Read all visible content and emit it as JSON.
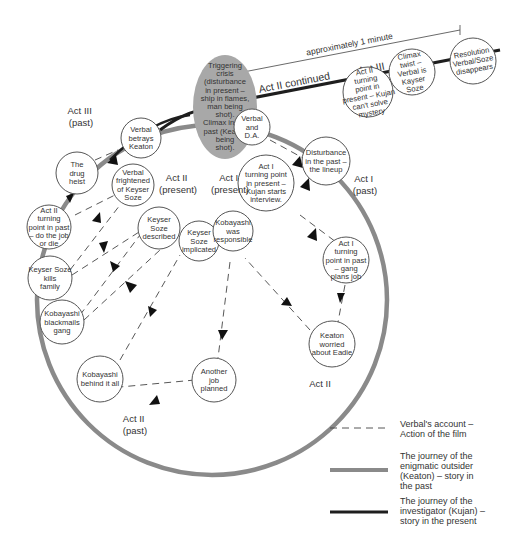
{
  "diagram": {
    "timeline": {
      "duration_label": "approximately 1 minute",
      "act2_continued_label": "Act II continued",
      "act3_label": "Act III"
    },
    "crisis": {
      "lines": [
        "Triggering",
        "crisis",
        "(disturbance",
        "in present –",
        "ship in flames,",
        "man being",
        "shot).",
        "Climax in the",
        "past (Keaton",
        "being",
        "shot)."
      ],
      "fill": "#a8a8a8"
    },
    "present_nodes": [
      {
        "id": "act2-turning-present",
        "lines": [
          "Act II",
          "turning",
          "point in",
          "present – Kujan",
          "can't solve",
          "mystery"
        ]
      },
      {
        "id": "climax-twist",
        "lines": [
          "Climax",
          "twist –",
          "Verbal is",
          "Kayser",
          "Soze"
        ]
      },
      {
        "id": "resolution",
        "lines": [
          "Resolution",
          "Verbal/Soze",
          "disappears"
        ]
      }
    ],
    "nodes": [
      {
        "id": "verbal-da",
        "lines": [
          "Verbal",
          "and",
          "D.A."
        ]
      },
      {
        "id": "disturbance-past",
        "lines": [
          "Disturbance",
          "in the past –",
          "the lineup"
        ]
      },
      {
        "id": "act1-turning-present",
        "lines": [
          "Act I",
          "turning point",
          "in present –",
          "Kujan starts",
          "interview."
        ]
      },
      {
        "id": "act1-turning-past",
        "lines": [
          "Act I",
          "turning",
          "point in past",
          "– gang",
          "plans job"
        ]
      },
      {
        "id": "keaton-worried",
        "lines": [
          "Keaton",
          "worried",
          "about Eadie"
        ]
      },
      {
        "id": "another-job",
        "lines": [
          "Another",
          "job",
          "planned"
        ]
      },
      {
        "id": "kobayashi-behind",
        "lines": [
          "Kobayashi",
          "behind it all"
        ]
      },
      {
        "id": "kobayashi-blackmails",
        "lines": [
          "Kobayashi",
          "blackmails",
          "gang"
        ]
      },
      {
        "id": "soze-kills-family",
        "lines": [
          "Keyser Soze",
          "kills",
          "family"
        ]
      },
      {
        "id": "act2-turning-past",
        "lines": [
          "Act II",
          "turning",
          "point in past",
          "– do the job",
          "or die"
        ]
      },
      {
        "id": "drug-heist",
        "lines": [
          "The",
          "drug",
          "heist"
        ]
      },
      {
        "id": "verbal-betrays",
        "lines": [
          "Verbal",
          "betrays",
          "Keaton"
        ]
      },
      {
        "id": "verbal-frightened",
        "lines": [
          "Verbal",
          "frightened",
          "of Keyser",
          "Soze"
        ]
      },
      {
        "id": "soze-described",
        "lines": [
          "Keyser",
          "Soze",
          "described"
        ]
      },
      {
        "id": "soze-implicated",
        "lines": [
          "Keyser",
          "Soze",
          "implicated"
        ]
      },
      {
        "id": "kobayashi-responsible",
        "lines": [
          "Kobayashi",
          "was",
          "responsible"
        ]
      }
    ],
    "act_labels": {
      "act3_past": [
        "Act III",
        "(past)"
      ],
      "act2_present": [
        "Act II",
        "(present)"
      ],
      "act1_present": [
        "Act I",
        "(present)"
      ],
      "act1_past": [
        "Act I",
        "(past)"
      ],
      "act2": [
        "Act II"
      ],
      "act2_past": [
        "Act II",
        "(past)"
      ]
    }
  },
  "legend": {
    "items": [
      {
        "style": "dashed",
        "lines": [
          "Verbal's account –",
          "Action of the film"
        ]
      },
      {
        "style": "grey-thick",
        "lines": [
          "The journey of the",
          "enigmatic outsider",
          "(Keaton) – story in",
          "the past"
        ]
      },
      {
        "style": "black-thick",
        "lines": [
          "The journey of the",
          "investigator (Kujan) –",
          "story in the present"
        ]
      }
    ]
  },
  "colors": {
    "past_line": "#8a8a8a",
    "present_line": "#1e1e1e",
    "crisis_fill": "#a8a8a8",
    "background": "#ffffff"
  }
}
